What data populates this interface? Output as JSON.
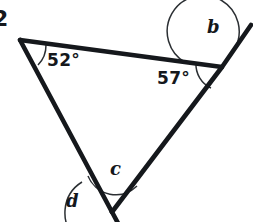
{
  "figure": {
    "type": "geometry-diagram",
    "background_color": "#ffffff",
    "stroke_color": "#15181c",
    "question_number": "2",
    "labels": {
      "angle_top_left": "52°",
      "angle_right": "57°",
      "unknown_b": "b",
      "unknown_c": "c",
      "unknown_d": "d"
    },
    "vertices": {
      "top_left": {
        "x": 20,
        "y": 40
      },
      "right": {
        "x": 222,
        "y": 67
      },
      "bottom": {
        "x": 112,
        "y": 212
      }
    },
    "extensions": {
      "right_ray_end": {
        "x": 251,
        "y": 25
      },
      "bottom_ray_end": {
        "x": 137,
        "y": 247
      }
    },
    "angles": [
      {
        "name": "angle-top-left",
        "vertex": "top_left",
        "label": "52°",
        "known": true
      },
      {
        "name": "angle-right-interior",
        "vertex": "right",
        "label": "57°",
        "known": true
      },
      {
        "name": "angle-b-exterior",
        "vertex": "right",
        "label": "b",
        "known": false
      },
      {
        "name": "angle-c-interior",
        "vertex": "bottom",
        "label": "c",
        "known": false
      },
      {
        "name": "angle-d-exterior",
        "vertex": "bottom",
        "label": "d",
        "known": false
      }
    ]
  }
}
